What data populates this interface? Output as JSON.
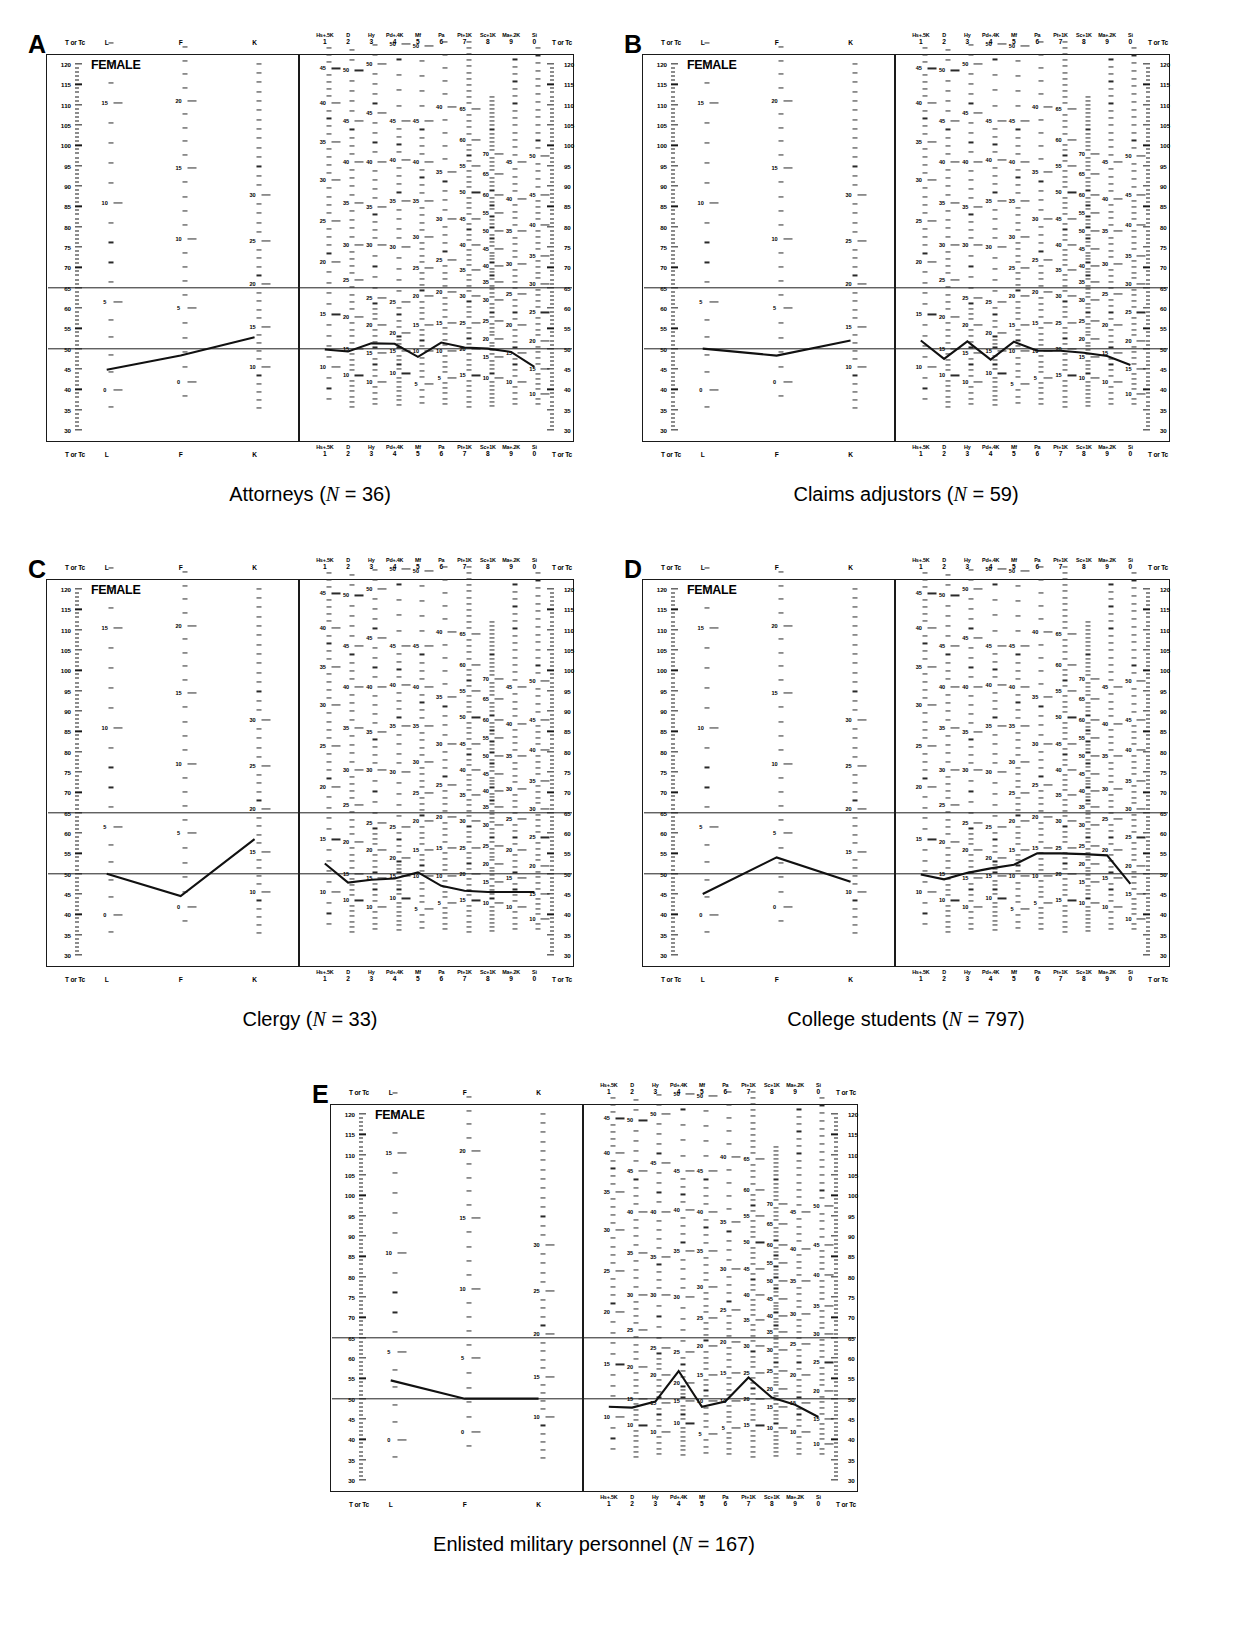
{
  "figure": {
    "norm_label": "FEMALE",
    "t_axis_label_left": "T or Tc",
    "t_axis_label_right": "T or Tc",
    "validity_scales": [
      {
        "code": "L",
        "number": ""
      },
      {
        "code": "F",
        "number": ""
      },
      {
        "code": "K",
        "number": ""
      }
    ],
    "clinical_scales": [
      {
        "code": "Hs+.5K",
        "number": "1"
      },
      {
        "code": "D",
        "number": "2"
      },
      {
        "code": "Hy",
        "number": "3"
      },
      {
        "code": "Pd+.4K",
        "number": "4"
      },
      {
        "code": "Mf",
        "number": "5"
      },
      {
        "code": "Pa",
        "number": "6"
      },
      {
        "code": "Pt+1K",
        "number": "7"
      },
      {
        "code": "Sc+1K",
        "number": "8"
      },
      {
        "code": "Ma+.2K",
        "number": "9"
      },
      {
        "code": "Si",
        "number": "0"
      }
    ],
    "t_ticks": [
      120,
      115,
      110,
      105,
      100,
      95,
      90,
      85,
      80,
      75,
      70,
      65,
      60,
      55,
      50,
      45,
      40,
      35,
      30
    ],
    "reference_lines": [
      65,
      50
    ],
    "axis_range": [
      30,
      120
    ]
  },
  "chart_data": {
    "type": "line",
    "xlabel": "MMPI-2 scale",
    "ylabel": "T or Tc score",
    "ylim": [
      30,
      120
    ],
    "grid": false,
    "legend": "none",
    "categories": [
      "L",
      "F",
      "K",
      "Hs+.5K",
      "D",
      "Hy",
      "Pd+.4K",
      "Mf",
      "Pa",
      "Pt+1K",
      "Sc+1K",
      "Ma+.2K",
      "Si"
    ],
    "series": [
      {
        "name": "Attorneys",
        "panel": "A",
        "n": 36,
        "values": [
          44.8,
          48.3,
          52.8,
          49.8,
          49.3,
          51.3,
          51.2,
          48.0,
          51.5,
          50.3,
          50.0,
          49.2,
          45.5
        ]
      },
      {
        "name": "Claims adjustors",
        "panel": "B",
        "n": 59,
        "values": [
          50.0,
          48.3,
          52.0,
          52.0,
          47.5,
          51.8,
          47.3,
          51.7,
          49.5,
          49.5,
          49.0,
          48.2,
          46.0
        ]
      },
      {
        "name": "Clergy",
        "panel": "C",
        "n": 33,
        "values": [
          50.0,
          44.5,
          58.5,
          52.5,
          47.8,
          48.5,
          48.8,
          50.3,
          47.0,
          45.8,
          45.5,
          45.5,
          45.5
        ]
      },
      {
        "name": "College students",
        "panel": "D",
        "n": 797,
        "values": [
          45.0,
          54.0,
          48.0,
          49.8,
          48.6,
          50.2,
          51.3,
          52.2,
          55.0,
          55.0,
          54.8,
          54.5,
          47.5
        ]
      },
      {
        "name": "Enlisted military personnel",
        "panel": "E",
        "n": 167,
        "values": [
          54.5,
          50.0,
          50.0,
          48.0,
          47.8,
          49.3,
          56.8,
          48.0,
          49.3,
          55.2,
          50.3,
          48.5,
          45.5
        ]
      }
    ]
  },
  "panels": [
    {
      "letter": "A",
      "caption_main": "Attorneys (",
      "caption_n": "N",
      "caption_tail": " = 36)"
    },
    {
      "letter": "B",
      "caption_main": "Claims adjustors (",
      "caption_n": "N",
      "caption_tail": " = 59)"
    },
    {
      "letter": "C",
      "caption_main": "Clergy (",
      "caption_n": "N",
      "caption_tail": " = 33)"
    },
    {
      "letter": "D",
      "caption_main": "College students (",
      "caption_n": "N",
      "caption_tail": " = 797)"
    },
    {
      "letter": "E",
      "caption_main": "Enlisted military personnel (",
      "caption_n": "N",
      "caption_tail": " = 167)"
    }
  ],
  "raw_score_columns": {
    "L": {
      "step": 5,
      "max": 15,
      "min": 0
    },
    "F": {
      "step": 5,
      "max": 20,
      "min": 0
    },
    "K": {
      "step": 5,
      "max": 30,
      "min": 10
    },
    "Hs+.5K": {
      "step": 5,
      "max": 45,
      "min": 10
    },
    "D": {
      "step": 5,
      "max": 50,
      "min": 10
    },
    "Hy": {
      "step": 5,
      "max": 50,
      "min": 10
    },
    "Pd+.4K": {
      "step": 5,
      "max": 50,
      "min": 10
    },
    "Mf": {
      "step": 5,
      "max": 30,
      "min": 5
    },
    "Pa": {
      "step": 5,
      "max": 30,
      "min": 5
    },
    "Pt+1K": {
      "step": 5,
      "max": 65,
      "min": 15
    },
    "Sc+1K": {
      "step": 5,
      "max": 70,
      "min": 10
    },
    "Ma+.2K": {
      "step": 5,
      "max": 40,
      "min": 10
    },
    "Si": {
      "step": 5,
      "max": 45,
      "min": 10
    }
  }
}
